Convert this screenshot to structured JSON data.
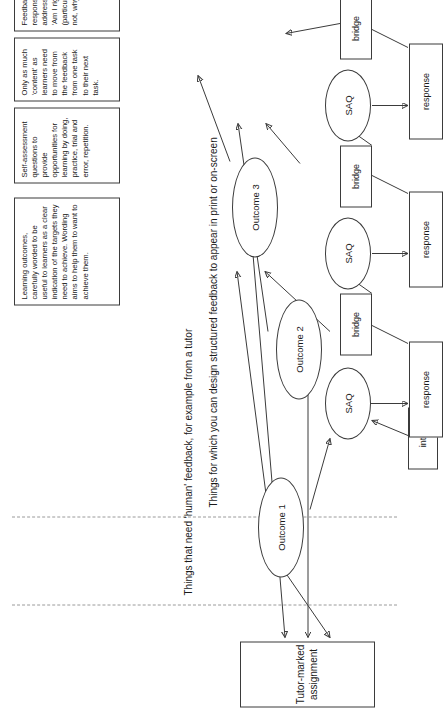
{
  "diagram": {
    "orientation": "rotated-90-ccw",
    "zones": [
      {
        "id": "human-feedback",
        "label": "Things that need 'human' feedback, for example from a tutor"
      },
      {
        "id": "structured-feedback",
        "label": "Things for which you can design structured feedback to appear in print or on-screen"
      }
    ],
    "tma": {
      "label": "Tutor-marked assignment"
    },
    "outcomes": [
      {
        "id": "outcome1",
        "label": "Outcome 1"
      },
      {
        "id": "outcome2",
        "label": "Outcome 2"
      },
      {
        "id": "outcome3",
        "label": "Outcome 3"
      }
    ],
    "saq_chains": [
      {
        "id": "chain1",
        "saq": "SAQ",
        "feeder": "intro",
        "response": "response"
      },
      {
        "id": "chain2",
        "saq": "SAQ",
        "feeder": "bridge",
        "response": "response"
      },
      {
        "id": "chain3",
        "saq": "SAQ",
        "feeder": "bridge",
        "response": "response"
      },
      {
        "id": "chain4",
        "saq": "SAQ",
        "feeder": "bridge",
        "response": "response"
      }
    ],
    "exit_bridge": "bridge",
    "annotations": [
      {
        "id": "note-outcomes",
        "text": "Learning outcomes, carefully worded to be useful to learners as a clear indication of the targets they need to achieve. Wording aims to help them to want to achieve them."
      },
      {
        "id": "note-saq",
        "text": "Self-assessment questions to provide opportunities for learning by doing, practice, trial and error, repetition."
      },
      {
        "id": "note-content",
        "text": "Only as much 'content' as learners need to move from the feedback from one task to their next task."
      },
      {
        "id": "note-feedback",
        "text": "Feedback responses, addressing 'Am I right' and (particularly) 'If not, why not?'"
      }
    ],
    "colors": {
      "stroke": "#3b3b3b",
      "dashed": "#9a9a9a",
      "text": "#1a1a1a",
      "background": "#ffffff"
    }
  }
}
